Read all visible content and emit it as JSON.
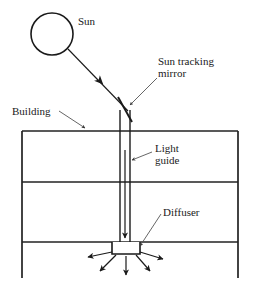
{
  "diagram": {
    "colors": {
      "stroke": "#1a1a1a",
      "wall": "#222222",
      "text": "#1a1a1a",
      "leader": "#555555",
      "background": "#ffffff",
      "fill_none": "none"
    },
    "labels": {
      "sun": "Sun",
      "mirror_line1": "Sun tracking",
      "mirror_line2": "mirror",
      "building": "Building",
      "guide_line1": "Light",
      "guide_line2": "guide",
      "diffuser": "Diffuser"
    },
    "elements": {
      "sun_circle": {
        "cx": 52,
        "cy": 34,
        "r": 21
      },
      "sun_ray": {
        "x1": 68,
        "y1": 49,
        "x2": 129,
        "y2": 112
      },
      "mirror": {
        "x1": 119,
        "y1": 98,
        "x2": 131,
        "y2": 120
      },
      "building_outline": {
        "left": 22,
        "right": 238,
        "top": 131,
        "bottom": 278
      },
      "floor_lines": [
        182,
        242
      ],
      "light_guide": {
        "left": 120,
        "right": 130,
        "top": 110,
        "bottom": 242
      },
      "diffuser_box": {
        "left": 112,
        "right": 140,
        "top": 242,
        "bottom": 254
      },
      "diffuser_rays": 5
    }
  }
}
